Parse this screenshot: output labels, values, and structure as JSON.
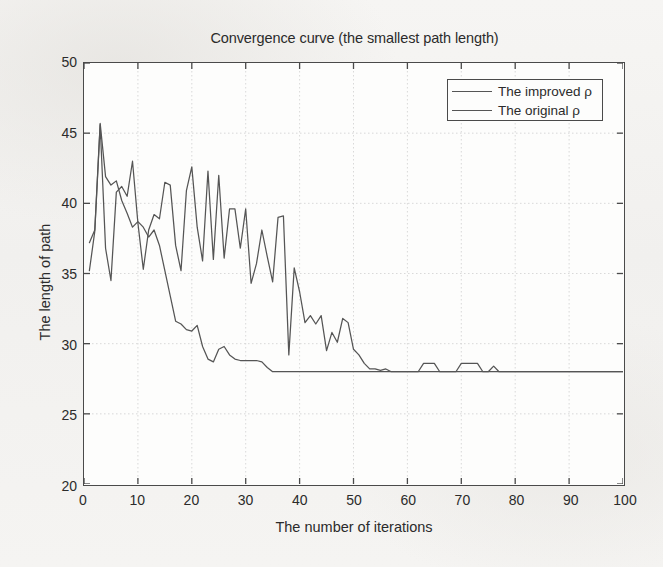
{
  "chart_data": {
    "type": "line",
    "title": "Convergence curve (the smallest path length)",
    "xlabel": "The number of iterations",
    "ylabel": "The length of path",
    "xlim": [
      0,
      100
    ],
    "ylim": [
      20,
      50
    ],
    "xticks": [
      0,
      10,
      20,
      30,
      40,
      50,
      60,
      70,
      80,
      90,
      100
    ],
    "yticks": [
      20,
      25,
      30,
      35,
      40,
      45,
      50
    ],
    "grid": true,
    "legend_position": "top-right",
    "line_color": "#555555",
    "axis_color": "#4a4a4a",
    "plot_bg": "#fdfdfc",
    "figure_bg": "#f4f3f1",
    "series": [
      {
        "name": "The improved ρ",
        "color": "#555555",
        "x": [
          1,
          2,
          3,
          4,
          5,
          6,
          7,
          8,
          9,
          10,
          11,
          12,
          13,
          14,
          15,
          16,
          17,
          18,
          19,
          20,
          21,
          22,
          23,
          24,
          25,
          26,
          27,
          28,
          29,
          30,
          31,
          32,
          33,
          34,
          35,
          36,
          37,
          38,
          39,
          40,
          41,
          42,
          43,
          44,
          45,
          46,
          47,
          48,
          49,
          50,
          51,
          52,
          53,
          54,
          55,
          56,
          57,
          58,
          59,
          60,
          61,
          62,
          63,
          64,
          65,
          66,
          67,
          68,
          69,
          70,
          71,
          72,
          73,
          74,
          75,
          76,
          77,
          78,
          79,
          80,
          81,
          82,
          83,
          84,
          85,
          86,
          87,
          88,
          89,
          90,
          91,
          92,
          93,
          94,
          95,
          96,
          97,
          98,
          99,
          100
        ],
        "y": [
          37.2,
          38.1,
          45.7,
          41.9,
          41.3,
          41.6,
          40.2,
          39.3,
          38.3,
          38.7,
          38.3,
          37.6,
          38.1,
          37.0,
          35.2,
          33.4,
          31.6,
          31.4,
          31.0,
          30.9,
          31.3,
          29.8,
          28.9,
          28.7,
          29.6,
          29.8,
          29.2,
          28.9,
          28.8,
          28.8,
          28.8,
          28.8,
          28.7,
          28.3,
          28.0,
          28.0,
          28.0,
          28.0,
          28.0,
          28.0,
          28.0,
          28.0,
          28.0,
          28.0,
          28.0,
          28.0,
          28.0,
          28.0,
          28.0,
          28.0,
          28.0,
          28.0,
          28.0,
          28.0,
          28.0,
          28.0,
          28.0,
          28.0,
          28.0,
          28.0,
          28.0,
          28.0,
          28.0,
          28.0,
          28.0,
          28.0,
          28.0,
          28.0,
          28.0,
          28.0,
          28.0,
          28.0,
          28.0,
          28.0,
          28.0,
          28.0,
          28.0,
          28.0,
          28.0,
          28.0,
          28.0,
          28.0,
          28.0,
          28.0,
          28.0,
          28.0,
          28.0,
          28.0,
          28.0,
          28.0,
          28.0,
          28.0,
          28.0,
          28.0,
          28.0,
          28.0,
          28.0,
          28.0,
          28.0,
          28.0
        ]
      },
      {
        "name": "The original ρ",
        "color": "#555555",
        "x": [
          1,
          2,
          3,
          4,
          5,
          6,
          7,
          8,
          9,
          10,
          11,
          12,
          13,
          14,
          15,
          16,
          17,
          18,
          19,
          20,
          21,
          22,
          23,
          24,
          25,
          26,
          27,
          28,
          29,
          30,
          31,
          32,
          33,
          34,
          35,
          36,
          37,
          38,
          39,
          40,
          41,
          42,
          43,
          44,
          45,
          46,
          47,
          48,
          49,
          50,
          51,
          52,
          53,
          54,
          55,
          56,
          57,
          58,
          59,
          60,
          61,
          62,
          63,
          64,
          65,
          66,
          67,
          68,
          69,
          70,
          71,
          72,
          73,
          74,
          75,
          76,
          77,
          78,
          79,
          80,
          81,
          82,
          83,
          84,
          85,
          86,
          87,
          88,
          89,
          90,
          91,
          92,
          93,
          94,
          95,
          96,
          97,
          98,
          99,
          100
        ],
        "y": [
          35.2,
          38.0,
          45.6,
          36.8,
          34.5,
          40.8,
          41.2,
          40.5,
          43.0,
          38.6,
          35.3,
          38.1,
          39.2,
          38.9,
          41.5,
          41.3,
          37.0,
          35.2,
          40.9,
          42.6,
          38.3,
          35.9,
          42.3,
          36.0,
          42.0,
          36.1,
          39.6,
          39.6,
          36.8,
          39.6,
          34.3,
          35.7,
          38.1,
          36.2,
          34.4,
          39.0,
          39.1,
          29.2,
          35.4,
          33.7,
          31.5,
          32.0,
          31.4,
          32.0,
          29.5,
          30.8,
          30.1,
          31.8,
          31.5,
          29.6,
          29.2,
          28.6,
          28.2,
          28.2,
          28.1,
          28.2,
          28.0,
          28.0,
          28.0,
          28.0,
          28.0,
          28.0,
          28.6,
          28.6,
          28.6,
          28.0,
          28.0,
          28.0,
          28.0,
          28.6,
          28.6,
          28.6,
          28.6,
          28.0,
          28.0,
          28.4,
          28.0,
          28.0,
          28.0,
          28.0,
          28.0,
          28.0,
          28.0,
          28.0,
          28.0,
          28.0,
          28.0,
          28.0,
          28.0,
          28.0,
          28.0,
          28.0,
          28.0,
          28.0,
          28.0,
          28.0,
          28.0,
          28.0,
          28.0,
          28.0
        ]
      }
    ]
  }
}
